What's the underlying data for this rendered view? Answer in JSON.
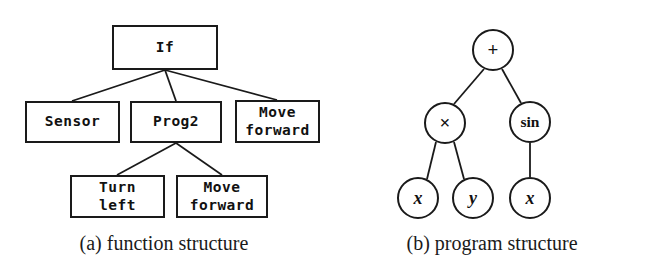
{
  "figures": [
    {
      "id": "function-structure",
      "caption": "(a) function structure",
      "type": "box-tree",
      "nodes": [
        {
          "name": "root",
          "lines": [
            "If"
          ],
          "x": 112,
          "y": 25,
          "w": 106,
          "h": 45
        },
        {
          "name": "sensor",
          "lines": [
            "Sensor"
          ],
          "x": 25,
          "y": 101,
          "w": 95,
          "h": 42
        },
        {
          "name": "prog2",
          "lines": [
            "Prog2"
          ],
          "x": 130,
          "y": 101,
          "w": 92,
          "h": 42
        },
        {
          "name": "move-forward-1",
          "lines": [
            "Move",
            "forward"
          ],
          "x": 235,
          "y": 100,
          "w": 85,
          "h": 43
        },
        {
          "name": "turn-left",
          "lines": [
            "Turn",
            "left"
          ],
          "x": 70,
          "y": 175,
          "w": 95,
          "h": 43
        },
        {
          "name": "move-forward-2",
          "lines": [
            "Move",
            "forward"
          ],
          "x": 176,
          "y": 175,
          "w": 92,
          "h": 43
        }
      ],
      "edges": [
        {
          "from": "root",
          "to": "sensor",
          "x1": 165,
          "y1": 70,
          "x2": 72,
          "y2": 101
        },
        {
          "from": "root",
          "to": "prog2",
          "x1": 165,
          "y1": 70,
          "x2": 176,
          "y2": 101
        },
        {
          "from": "root",
          "to": "move-forward-1",
          "x1": 165,
          "y1": 70,
          "x2": 277,
          "y2": 100
        },
        {
          "from": "prog2",
          "to": "turn-left",
          "x1": 176,
          "y1": 143,
          "x2": 117,
          "y2": 175
        },
        {
          "from": "prog2",
          "to": "move-forward-2",
          "x1": 176,
          "y1": 143,
          "x2": 222,
          "y2": 175
        }
      ]
    },
    {
      "id": "program-structure",
      "caption": "(b) program structure",
      "type": "circle-tree",
      "nodes": [
        {
          "name": "plus",
          "label": "+",
          "style": "op",
          "cx": 165,
          "cy": 50,
          "r": 21
        },
        {
          "name": "times",
          "label": "×",
          "style": "op",
          "cx": 117,
          "cy": 123,
          "r": 21
        },
        {
          "name": "sin",
          "label": "sin",
          "style": "fn",
          "cx": 202,
          "cy": 122,
          "r": 21
        },
        {
          "name": "var-x-left",
          "label": "x",
          "style": "italic",
          "cx": 90,
          "cy": 198,
          "r": 21
        },
        {
          "name": "var-y",
          "label": "y",
          "style": "italic",
          "cx": 145,
          "cy": 198,
          "r": 21
        },
        {
          "name": "var-x-right",
          "label": "x",
          "style": "italic",
          "cx": 202,
          "cy": 198,
          "r": 21
        }
      ],
      "edges": [
        {
          "from": "plus",
          "to": "times",
          "x1": 156,
          "y1": 69,
          "x2": 126,
          "y2": 104
        },
        {
          "from": "plus",
          "to": "sin",
          "x1": 174,
          "y1": 69,
          "x2": 193,
          "y2": 103
        },
        {
          "from": "times",
          "to": "var-x-left",
          "x1": 108,
          "y1": 142,
          "x2": 99,
          "y2": 179
        },
        {
          "from": "times",
          "to": "var-y",
          "x1": 126,
          "y1": 142,
          "x2": 136,
          "y2": 179
        },
        {
          "from": "sin",
          "to": "var-x-right",
          "x1": 202,
          "y1": 143,
          "x2": 202,
          "y2": 177
        }
      ]
    }
  ]
}
